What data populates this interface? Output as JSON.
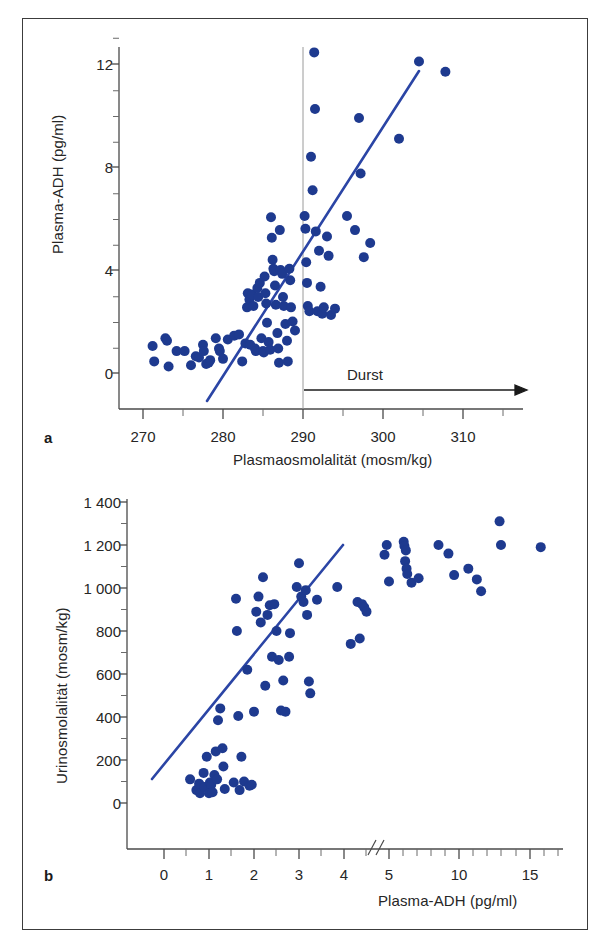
{
  "figure": {
    "background": "#ffffff",
    "border_color": "#3c3c3c",
    "marker_color": "#1e3a8f",
    "line_color": "#2b45a5",
    "axis_color": "#4a4a4a",
    "text_color": "#262626"
  },
  "panel_a": {
    "letter": "a",
    "xlabel": "Plasmaosmolalität (mosm/kg)",
    "ylabel": "Plasma-ADH (pg/ml)",
    "xticks": [
      "270",
      "280",
      "290",
      "300",
      "310"
    ],
    "yticks": [
      "12",
      "8",
      "4",
      "0"
    ],
    "annotation": "Durst"
  },
  "panel_b": {
    "letter": "b",
    "xlabel": "Plasma-ADH (pg/ml)",
    "ylabel": "Urinosmolalität (mosm/kg)",
    "xticks": [
      "0",
      "1",
      "2",
      "3",
      "4",
      "5",
      "10",
      "15"
    ],
    "yticks": [
      "1 400",
      "1 200",
      "1 000",
      "800",
      "600",
      "400",
      "200",
      "0"
    ]
  },
  "chart_data": [
    {
      "type": "scatter",
      "panel": "a",
      "title": "",
      "xlabel": "Plasmaosmolalität (mosm/kg)",
      "ylabel": "Plasma-ADH (pg/ml)",
      "xlim": [
        268,
        314
      ],
      "ylim": [
        -0.6,
        13.2
      ],
      "xticks": [
        270,
        280,
        290,
        300,
        310
      ],
      "xminorticks": [
        275,
        285,
        295,
        305
      ],
      "yticks": [
        0,
        4,
        8,
        12
      ],
      "yminorticks": [
        1,
        2,
        3,
        5,
        6,
        7,
        9,
        10,
        11,
        13
      ],
      "grid": false,
      "legend": "none",
      "annotations": [
        {
          "text": "Durst",
          "x": 298.5,
          "y": 1.15,
          "type": "label"
        },
        {
          "text": "",
          "type": "arrow",
          "x_start": 290,
          "x_end": 312.5,
          "y": 0.35
        },
        {
          "text": "",
          "type": "vline",
          "x": 290,
          "y_start": -0.6,
          "y_end": 13.2
        }
      ],
      "regression_line": {
        "x": [
          281.0,
          307.5
        ],
        "y": [
          0.3,
          13.1
        ]
      },
      "points": [
        [
          271.2,
          1.05
        ],
        [
          271.4,
          0.45
        ],
        [
          272.8,
          1.35
        ],
        [
          273.0,
          1.25
        ],
        [
          273.2,
          0.25
        ],
        [
          274.2,
          0.85
        ],
        [
          275.2,
          0.85
        ],
        [
          276.0,
          0.3
        ],
        [
          276.6,
          0.65
        ],
        [
          277.0,
          0.6
        ],
        [
          277.5,
          1.1
        ],
        [
          277.6,
          0.85
        ],
        [
          277.9,
          0.35
        ],
        [
          278.2,
          0.4
        ],
        [
          278.4,
          0.5
        ],
        [
          279.1,
          1.35
        ],
        [
          279.5,
          0.95
        ],
        [
          279.6,
          0.85
        ],
        [
          280.0,
          0.55
        ],
        [
          280.6,
          1.3
        ],
        [
          281.4,
          1.45
        ],
        [
          282.0,
          1.5
        ],
        [
          282.4,
          0.45
        ],
        [
          282.8,
          1.15
        ],
        [
          283.0,
          2.55
        ],
        [
          283.1,
          3.1
        ],
        [
          283.3,
          2.85
        ],
        [
          283.4,
          1.1
        ],
        [
          283.6,
          3.05
        ],
        [
          283.8,
          2.6
        ],
        [
          284.0,
          0.95
        ],
        [
          284.1,
          0.85
        ],
        [
          284.3,
          3.3
        ],
        [
          284.4,
          2.95
        ],
        [
          284.6,
          3.5
        ],
        [
          284.8,
          1.35
        ],
        [
          285.0,
          0.85
        ],
        [
          285.1,
          0.8
        ],
        [
          285.2,
          3.75
        ],
        [
          285.3,
          3.1
        ],
        [
          285.4,
          2.7
        ],
        [
          285.5,
          1.95
        ],
        [
          285.7,
          1.2
        ],
        [
          285.9,
          0.9
        ],
        [
          286.0,
          6.05
        ],
        [
          286.1,
          5.25
        ],
        [
          286.2,
          4.4
        ],
        [
          286.3,
          4.05
        ],
        [
          286.4,
          3.95
        ],
        [
          286.5,
          3.4
        ],
        [
          286.6,
          2.65
        ],
        [
          286.8,
          1.55
        ],
        [
          286.9,
          0.95
        ],
        [
          287.0,
          0.4
        ],
        [
          287.1,
          5.55
        ],
        [
          287.2,
          4.0
        ],
        [
          287.4,
          3.85
        ],
        [
          287.5,
          2.95
        ],
        [
          287.6,
          2.6
        ],
        [
          287.8,
          1.9
        ],
        [
          288.0,
          1.25
        ],
        [
          288.1,
          0.45
        ],
        [
          288.3,
          4.05
        ],
        [
          288.4,
          3.6
        ],
        [
          288.5,
          2.55
        ],
        [
          288.7,
          2.0
        ],
        [
          289.0,
          1.65
        ],
        [
          290.2,
          6.1
        ],
        [
          290.3,
          5.6
        ],
        [
          290.4,
          4.3
        ],
        [
          290.5,
          3.5
        ],
        [
          290.6,
          2.6
        ],
        [
          290.8,
          2.4
        ],
        [
          291.0,
          8.4
        ],
        [
          291.2,
          7.1
        ],
        [
          291.4,
          12.45
        ],
        [
          291.5,
          10.25
        ],
        [
          291.6,
          5.5
        ],
        [
          291.8,
          2.4
        ],
        [
          292.0,
          4.75
        ],
        [
          292.2,
          3.35
        ],
        [
          292.4,
          2.3
        ],
        [
          292.6,
          2.55
        ],
        [
          293.0,
          5.3
        ],
        [
          293.2,
          4.55
        ],
        [
          293.5,
          2.25
        ],
        [
          294.0,
          2.5
        ],
        [
          295.5,
          6.1
        ],
        [
          296.5,
          5.55
        ],
        [
          297.0,
          9.9
        ],
        [
          297.2,
          7.75
        ],
        [
          297.6,
          4.5
        ],
        [
          298.4,
          5.05
        ],
        [
          302.0,
          9.1
        ],
        [
          304.5,
          12.1
        ],
        [
          307.8,
          11.7
        ]
      ]
    },
    {
      "type": "scatter",
      "panel": "b",
      "title": "",
      "xlabel": "Plasma-ADH (pg/ml)",
      "ylabel": "Urinosmolalität (mosm/kg)",
      "xlim": [
        0,
        16.2
      ],
      "ylim": [
        -60,
        1420
      ],
      "xticks": [
        0,
        1,
        2,
        3,
        4,
        5,
        10,
        15
      ],
      "yticks": [
        0,
        200,
        400,
        600,
        800,
        1000,
        1200,
        1400
      ],
      "yminorticks": [
        100,
        300,
        500,
        700,
        900,
        1100,
        1300
      ],
      "axis_break": {
        "between": [
          5,
          10
        ],
        "marker": "//"
      },
      "grid": false,
      "legend": "none",
      "regression_line": {
        "x": [
          0.55,
          4.8
        ],
        "y": [
          110,
          1200
        ]
      },
      "points": [
        [
          0.58,
          110
        ],
        [
          0.72,
          60
        ],
        [
          0.78,
          90
        ],
        [
          0.8,
          45
        ],
        [
          0.88,
          140
        ],
        [
          0.9,
          75
        ],
        [
          0.95,
          215
        ],
        [
          1.0,
          45
        ],
        [
          1.02,
          95
        ],
        [
          1.05,
          85
        ],
        [
          1.08,
          50
        ],
        [
          1.12,
          130
        ],
        [
          1.15,
          240
        ],
        [
          1.18,
          110
        ],
        [
          1.2,
          385
        ],
        [
          1.25,
          440
        ],
        [
          1.3,
          255
        ],
        [
          1.32,
          170
        ],
        [
          1.35,
          65
        ],
        [
          1.55,
          95
        ],
        [
          1.6,
          950
        ],
        [
          1.62,
          800
        ],
        [
          1.65,
          405
        ],
        [
          1.68,
          60
        ],
        [
          1.72,
          215
        ],
        [
          1.78,
          100
        ],
        [
          1.85,
          620
        ],
        [
          1.9,
          80
        ],
        [
          1.95,
          85
        ],
        [
          2.0,
          425
        ],
        [
          2.05,
          890
        ],
        [
          2.1,
          960
        ],
        [
          2.15,
          840
        ],
        [
          2.2,
          1050
        ],
        [
          2.25,
          545
        ],
        [
          2.3,
          875
        ],
        [
          2.35,
          920
        ],
        [
          2.4,
          680
        ],
        [
          2.45,
          925
        ],
        [
          2.5,
          800
        ],
        [
          2.55,
          665
        ],
        [
          2.6,
          430
        ],
        [
          2.65,
          570
        ],
        [
          2.7,
          425
        ],
        [
          2.78,
          680
        ],
        [
          2.8,
          790
        ],
        [
          2.95,
          1005
        ],
        [
          3.0,
          1115
        ],
        [
          3.05,
          960
        ],
        [
          3.1,
          935
        ],
        [
          3.15,
          990
        ],
        [
          3.18,
          875
        ],
        [
          3.22,
          565
        ],
        [
          3.25,
          510
        ],
        [
          3.4,
          945
        ],
        [
          3.85,
          1005
        ],
        [
          4.15,
          740
        ],
        [
          4.3,
          935
        ],
        [
          4.35,
          765
        ],
        [
          4.4,
          925
        ],
        [
          4.45,
          910
        ],
        [
          4.5,
          890
        ],
        [
          4.9,
          1155
        ],
        [
          4.95,
          1200
        ],
        [
          5.0,
          1030
        ],
        [
          5.05,
          1215
        ],
        [
          5.1,
          1195
        ],
        [
          5.15,
          1125
        ],
        [
          5.2,
          1175
        ],
        [
          5.25,
          1090
        ],
        [
          5.3,
          1065
        ],
        [
          5.6,
          1025
        ],
        [
          6.1,
          1045
        ],
        [
          7.5,
          1200
        ],
        [
          8.2,
          1160
        ],
        [
          8.6,
          1060
        ],
        [
          9.6,
          1090
        ],
        [
          10.2,
          1040
        ],
        [
          10.5,
          985
        ],
        [
          11.8,
          1310
        ],
        [
          11.9,
          1200
        ],
        [
          14.7,
          1190
        ]
      ]
    }
  ]
}
